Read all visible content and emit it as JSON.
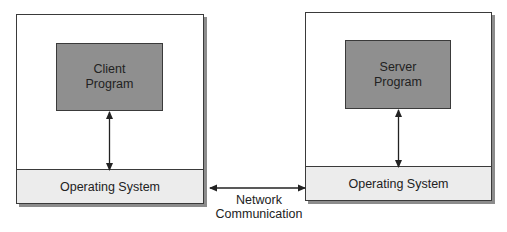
{
  "client_machine": {
    "program_label_line1": "Client",
    "program_label_line2": "Program",
    "os_label": "Operating System"
  },
  "server_machine": {
    "program_label_line1": "Server",
    "program_label_line2": "Program",
    "os_label": "Operating System"
  },
  "network": {
    "label_line1": "Network",
    "label_line2": "Communication"
  },
  "colors": {
    "program_fill": "#8f8f8f",
    "os_fill": "#ececec",
    "border": "#3a3a3a",
    "shadow": "#8c8c8c"
  }
}
